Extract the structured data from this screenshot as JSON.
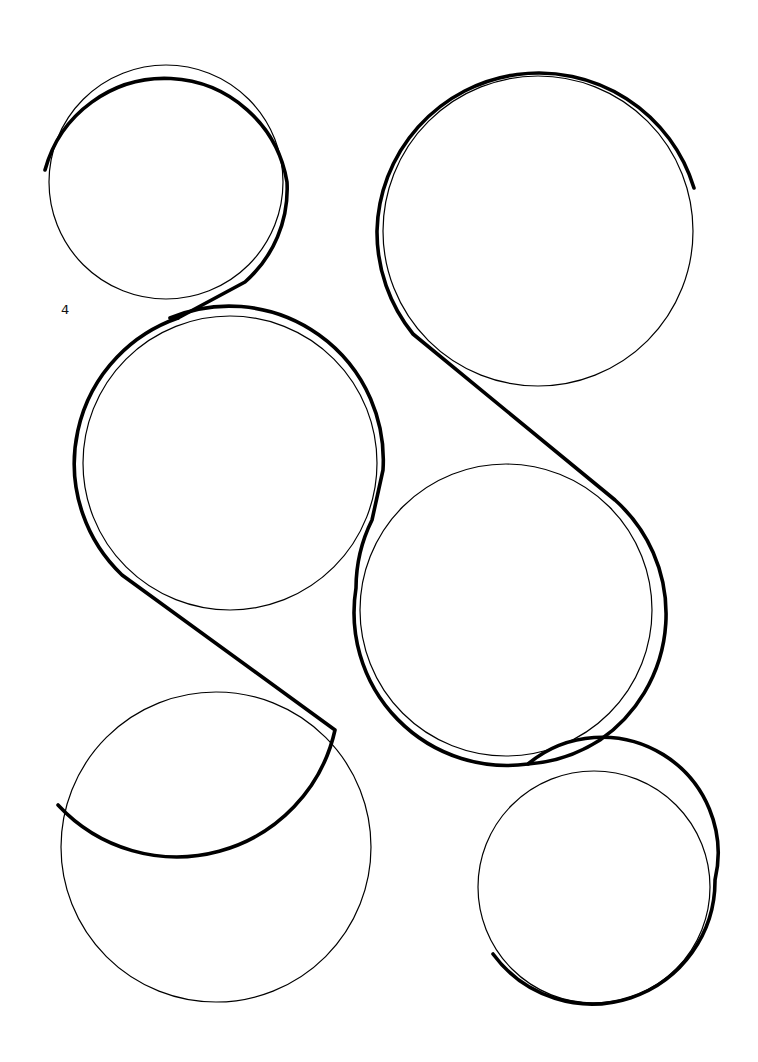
{
  "page": {
    "number_label": "4"
  },
  "diagram": {
    "colors": {
      "background": "#ffffff",
      "stroke": "#000000"
    },
    "circles": [
      {
        "id": "top-left",
        "cx": 166,
        "cy": 182,
        "r": 117
      },
      {
        "id": "top-right",
        "cx": 538,
        "cy": 231,
        "r": 155
      },
      {
        "id": "middle-left",
        "cx": 230,
        "cy": 463,
        "r": 147
      },
      {
        "id": "middle-right",
        "cx": 506,
        "cy": 610,
        "r": 146
      },
      {
        "id": "bottom-left",
        "cx": 216,
        "cy": 847,
        "r": 155
      },
      {
        "id": "bottom-right",
        "cx": 594,
        "cy": 887,
        "r": 116
      }
    ]
  }
}
